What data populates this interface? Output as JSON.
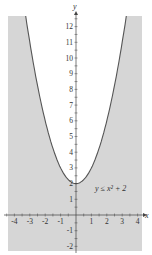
{
  "chart_data": {
    "type": "area",
    "title": "",
    "inequality_label": "y ≤ x² + 2",
    "boundary_function": "y = x^2 + 2",
    "shaded_region": "below curve",
    "xlabel": "x",
    "ylabel": "y",
    "xlim": [
      -4.4,
      4.3
    ],
    "ylim": [
      -2.3,
      12.7
    ],
    "x_ticks": [
      -4,
      -3,
      -2,
      -1,
      1,
      2,
      3,
      4
    ],
    "y_ticks": [
      -2,
      -1,
      1,
      2,
      3,
      4,
      5,
      6,
      7,
      8,
      9,
      10,
      11,
      12
    ],
    "x_tick_labels": [
      "-4",
      "-3",
      "-2",
      "-1",
      "1",
      "2",
      "3",
      "4"
    ],
    "y_tick_labels": [
      "-2",
      "-1",
      "1",
      "2",
      "3",
      "4",
      "5",
      "6",
      "7",
      "8",
      "9",
      "10",
      "11",
      "12"
    ],
    "curve_points": [
      {
        "x": -3.24,
        "y": 12.5
      },
      {
        "x": -3,
        "y": 11
      },
      {
        "x": -2,
        "y": 6
      },
      {
        "x": -1,
        "y": 3
      },
      {
        "x": 0,
        "y": 2
      },
      {
        "x": 1,
        "y": 3
      },
      {
        "x": 2,
        "y": 6
      },
      {
        "x": 3,
        "y": 11
      },
      {
        "x": 3.24,
        "y": 12.5
      }
    ],
    "grid": false,
    "colors": {
      "shade": "#d6d6d6",
      "curve": "#555555",
      "axis": "#444444"
    }
  }
}
